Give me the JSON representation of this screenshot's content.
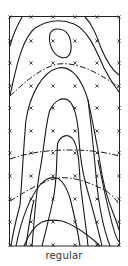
{
  "figure": {
    "caption": "regular",
    "frame": {
      "x": 9.5,
      "y": 16.5,
      "width": 110,
      "height": 229.5
    },
    "grid_markers": {
      "symbol": "x",
      "columns_x": [
        10,
        31,
        53,
        75,
        97,
        119
      ],
      "rows_y": [
        17,
        41,
        63,
        86,
        108,
        131,
        153,
        176,
        199,
        222,
        245
      ]
    },
    "colors": {
      "line": "#1a1a1a",
      "frame": "#222222",
      "marker": "#333333"
    }
  }
}
